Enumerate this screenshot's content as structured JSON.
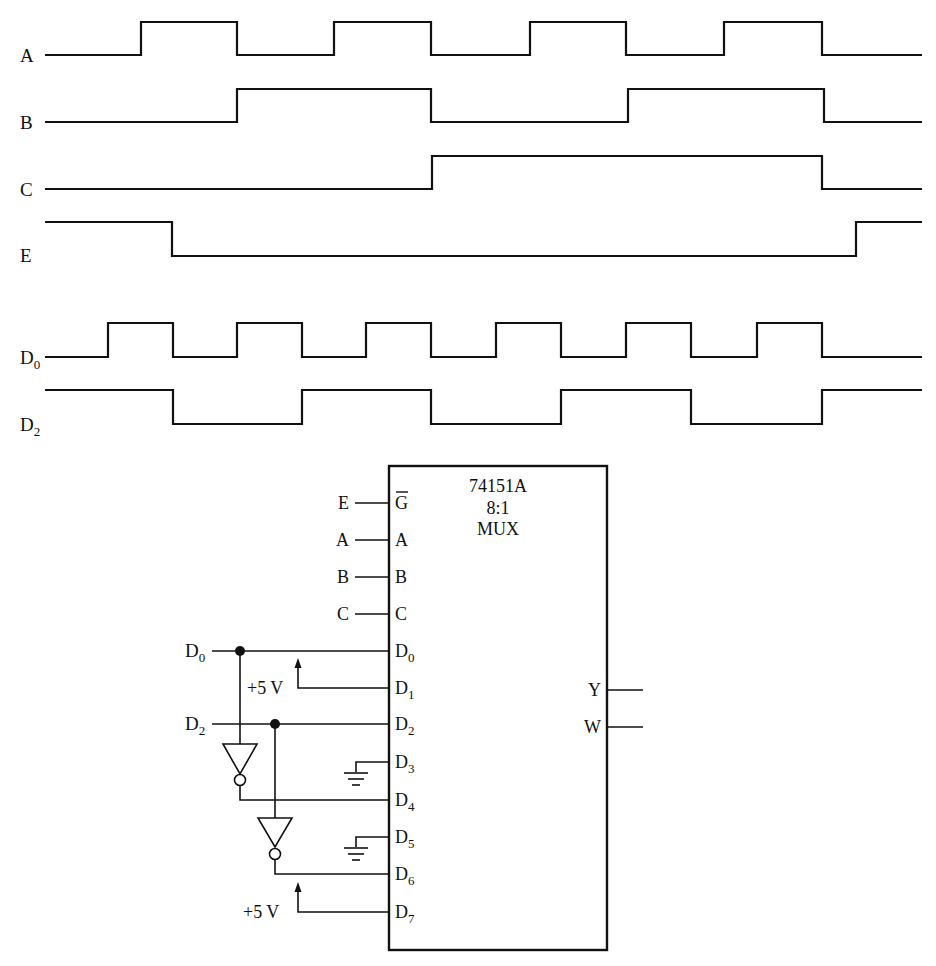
{
  "timing_diagram": {
    "x_start": 45,
    "x_end": 922,
    "signals": [
      {
        "name": "A",
        "sub": "",
        "label_y": 55,
        "high_y": 22,
        "low_y": 55,
        "initial": 0,
        "edges": [
          141,
          237,
          334,
          431,
          530,
          626,
          724,
          822
        ]
      },
      {
        "name": "B",
        "sub": "",
        "label_y": 122,
        "high_y": 89,
        "low_y": 122,
        "initial": 0,
        "edges": [
          237,
          431,
          628,
          824
        ]
      },
      {
        "name": "C",
        "sub": "",
        "label_y": 189,
        "high_y": 156,
        "low_y": 189,
        "initial": 0,
        "edges": [
          432,
          822
        ]
      },
      {
        "name": "E",
        "sub": "",
        "label_y": 255,
        "high_y": 222,
        "low_y": 256,
        "initial": 1,
        "edges": [
          172,
          856
        ]
      },
      {
        "name": "D",
        "sub": "0",
        "label_y": 357,
        "high_y": 323,
        "low_y": 357,
        "initial": 0,
        "edges": [
          108,
          173,
          237,
          302,
          366,
          431,
          496,
          561,
          626,
          691,
          757,
          822
        ]
      },
      {
        "name": "D",
        "sub": "2",
        "label_y": 424,
        "high_y": 390,
        "low_y": 424,
        "initial": 1,
        "edges": [
          173,
          302,
          431,
          561,
          691,
          822
        ]
      }
    ]
  },
  "circuit": {
    "chip": {
      "part_number": "74151A",
      "ratio": "8:1",
      "type": "MUX",
      "x": 389,
      "y": 466,
      "width": 218,
      "height": 484
    },
    "control_inputs": [
      {
        "ext_label": "E",
        "pin_label": "G",
        "overbar": true,
        "y": 503
      },
      {
        "ext_label": "A",
        "pin_label": "A",
        "overbar": false,
        "y": 540
      },
      {
        "ext_label": "B",
        "pin_label": "B",
        "overbar": false,
        "y": 577
      },
      {
        "ext_label": "C",
        "pin_label": "C",
        "overbar": false,
        "y": 614
      }
    ],
    "data_pins": [
      {
        "pin": "D",
        "sub": "0",
        "y": 651,
        "connection": "D0 input"
      },
      {
        "pin": "D",
        "sub": "1",
        "y": 688,
        "connection": "+5 V"
      },
      {
        "pin": "D",
        "sub": "2",
        "y": 724,
        "connection": "D2 input"
      },
      {
        "pin": "D",
        "sub": "3",
        "y": 762,
        "connection": "ground"
      },
      {
        "pin": "D",
        "sub": "4",
        "y": 800,
        "connection": "NOT D0"
      },
      {
        "pin": "D",
        "sub": "5",
        "y": 837,
        "connection": "ground"
      },
      {
        "pin": "D",
        "sub": "6",
        "y": 874,
        "connection": "NOT D2"
      },
      {
        "pin": "D",
        "sub": "7",
        "y": 912,
        "connection": "+5 V"
      }
    ],
    "outputs": [
      {
        "label": "Y",
        "y": 690
      },
      {
        "label": "W",
        "y": 727
      }
    ],
    "external_inputs": [
      {
        "name": "D",
        "sub": "0",
        "y": 651
      },
      {
        "name": "D",
        "sub": "2",
        "y": 724
      }
    ],
    "supply_labels": [
      {
        "text": "+5 V",
        "y": 688
      },
      {
        "text": "+5 V",
        "y": 912
      }
    ]
  },
  "colors": {
    "ink": "#111111",
    "paper": "#ffffff"
  }
}
